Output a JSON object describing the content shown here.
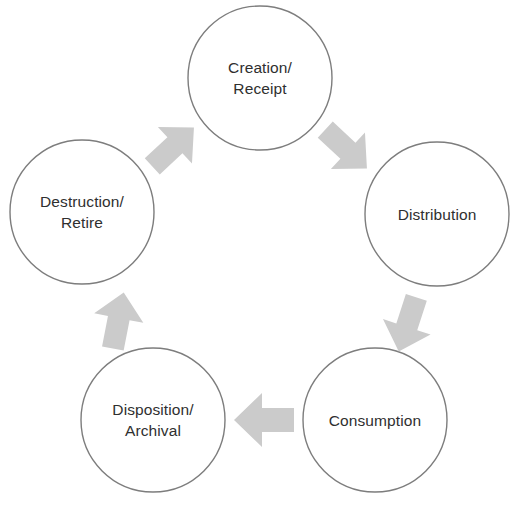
{
  "diagram": {
    "type": "cycle",
    "direction": "clockwise",
    "background_color": "#ffffff",
    "circle_stroke_color": "#7d7d7d",
    "circle_fill_color": "#ffffff",
    "arrow_color": "#cbcbcb",
    "text_color": "#2f2f2f",
    "nodes": [
      {
        "id": "creation-receipt",
        "line1": "Creation/",
        "line2": "Receipt",
        "cx": 260,
        "cy": 78,
        "r": 72
      },
      {
        "id": "distribution",
        "line1": "Distribution",
        "line2": "",
        "cx": 437,
        "cy": 214,
        "r": 72
      },
      {
        "id": "consumption",
        "line1": "Consumption",
        "line2": "",
        "cx": 375,
        "cy": 420,
        "r": 72
      },
      {
        "id": "disposition-archival",
        "line1": "Disposition/",
        "line2": "Archival",
        "cx": 153,
        "cy": 420,
        "r": 72
      },
      {
        "id": "destruction-retire",
        "line1": "Destruction/",
        "line2": "Retire",
        "cx": 82,
        "cy": 212,
        "r": 72
      }
    ],
    "arrows": [
      {
        "id": "arrow-destruction-to-creation",
        "from": "destruction-retire",
        "to": "creation-receipt",
        "direction": "up-right"
      },
      {
        "id": "arrow-creation-to-distribution",
        "from": "creation-receipt",
        "to": "distribution",
        "direction": "down-right"
      },
      {
        "id": "arrow-distribution-to-consumption",
        "from": "distribution",
        "to": "consumption",
        "direction": "down-left"
      },
      {
        "id": "arrow-consumption-to-disposition",
        "from": "consumption",
        "to": "disposition-archival",
        "direction": "left"
      },
      {
        "id": "arrow-disposition-to-destruction",
        "from": "disposition-archival",
        "to": "destruction-retire",
        "direction": "up"
      }
    ]
  },
  "caption": {
    "text": ""
  }
}
